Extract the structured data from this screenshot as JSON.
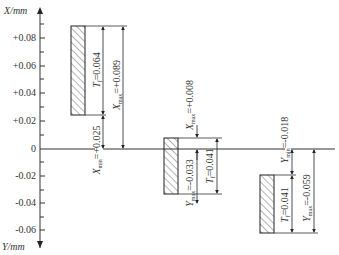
{
  "diagram": {
    "type": "tolerance_zone_diagram",
    "y_axis": {
      "top_label": "X/mm",
      "bottom_label": "Y/mm",
      "ticks": [
        "+0.08",
        "+0.06",
        "+0.04",
        "+0.02",
        "0",
        "-0.02",
        "-0.04",
        "-0.06"
      ],
      "tick_values": [
        0.08,
        0.06,
        0.04,
        0.02,
        0,
        -0.02,
        -0.04,
        -0.06
      ]
    },
    "zones": [
      {
        "name": "clearance-fit",
        "hole_tolerance_label": "T",
        "hole_tolerance_sub": "f",
        "hole_tolerance_value": "=0.064",
        "max_label": "X",
        "max_sub": "max",
        "max_value": "=+0.089",
        "min_label": "X",
        "min_sub": "min",
        "min_value": "=+0.025",
        "upper": 0.089,
        "lower": 0.025
      },
      {
        "name": "transition-fit",
        "max_label": "X",
        "max_sub": "max",
        "max_value": "=+0.008",
        "min_label": "Y",
        "min_sub": "max",
        "min_value": "=-0.033",
        "tolerance_label": "T",
        "tolerance_sub": "f",
        "tolerance_value": "=0.041",
        "upper": 0.008,
        "lower": -0.033
      },
      {
        "name": "interference-fit",
        "min_label": "Y",
        "min_sub": "min",
        "min_value": "=-0.018",
        "tolerance_label": "T",
        "tolerance_sub": "f",
        "tolerance_value": "=0.041",
        "max_label": "Y",
        "max_sub": "max",
        "max_value": "=-0.059",
        "upper": -0.018,
        "lower": -0.059
      }
    ],
    "colors": {
      "line": "#333333",
      "hatch": "#444444",
      "background": "#ffffff"
    }
  }
}
